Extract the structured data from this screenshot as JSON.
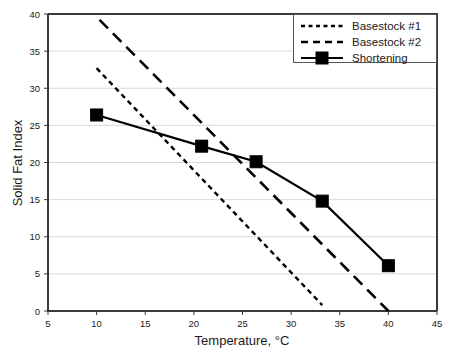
{
  "chart_data": {
    "type": "line",
    "title": "",
    "xlabel": "Temperature, °C",
    "ylabel": "Solid Fat Index",
    "xlim": [
      5,
      45
    ],
    "ylim": [
      0,
      40
    ],
    "xticks": [
      5,
      10,
      15,
      20,
      25,
      30,
      35,
      40,
      45
    ],
    "yticks": [
      0,
      5,
      10,
      15,
      20,
      25,
      30,
      35,
      40
    ],
    "grid": "horizontal",
    "legend_position": "top-right",
    "series": [
      {
        "name": "Basestock #1",
        "style": "dotted",
        "marker": "none",
        "color": "#000000",
        "x": [
          10.0,
          33.2
        ],
        "y": [
          32.7,
          0.8
        ]
      },
      {
        "name": "Basestock #2",
        "style": "dashed",
        "marker": "none",
        "color": "#000000",
        "x": [
          10.3,
          40.0
        ],
        "y": [
          39.2,
          0.0
        ]
      },
      {
        "name": "Shortening",
        "style": "solid",
        "marker": "square",
        "color": "#000000",
        "x": [
          10.0,
          20.8,
          26.4,
          33.2,
          40.0
        ],
        "y": [
          26.4,
          22.2,
          20.1,
          14.8,
          6.1
        ]
      }
    ]
  },
  "legend": {
    "items": [
      {
        "label": "Basestock #1"
      },
      {
        "label": "Basestock #2"
      },
      {
        "label": "Shortening"
      }
    ]
  },
  "axes": {
    "x_title": "Temperature, °C",
    "y_title": "Solid Fat Index",
    "x_tick_labels": [
      "5",
      "10",
      "15",
      "20",
      "25",
      "30",
      "35",
      "40",
      "45"
    ],
    "y_tick_labels": [
      "0",
      "5",
      "10",
      "15",
      "20",
      "25",
      "30",
      "35",
      "40"
    ]
  },
  "colors": {
    "line": "#000000",
    "grid": "#d9d9d9",
    "axis": "#3a3a3a",
    "background": "#ffffff"
  }
}
